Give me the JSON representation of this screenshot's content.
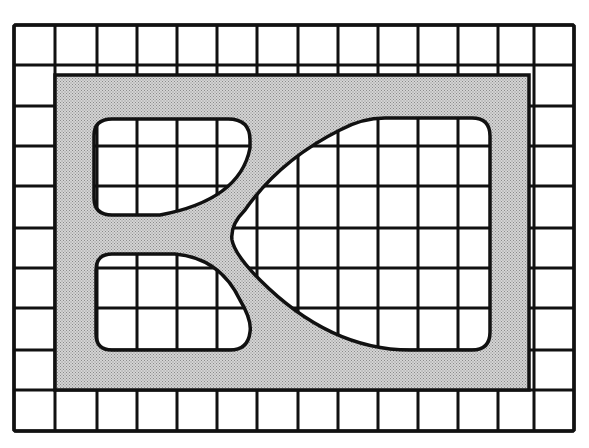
{
  "diagram": {
    "colors": {
      "background": "#ffffff",
      "line": "#111111",
      "shade": "#d4d4d4",
      "stipple": "#8a8a8a"
    },
    "outer_frame": {
      "x": 14,
      "y": 25,
      "w": 560,
      "h": 406
    },
    "grid": {
      "columns_x": [
        14,
        55,
        97,
        137,
        177,
        217,
        257,
        298,
        338,
        378,
        418,
        458,
        498,
        534,
        574
      ],
      "rows_y": [
        25,
        65,
        106,
        146,
        186,
        228,
        268,
        308,
        350,
        390,
        431
      ]
    },
    "shaded_band_outer": {
      "x": 55,
      "y": 75,
      "w": 474,
      "h": 315
    },
    "regions": [
      {
        "name": "upper-left-region",
        "path": "M 112 119 L 228 119 Q 250 119 250 140 L 250 148 Q 240 200 160 215 L 112 215 Q 94 215 94 198 L 94 136 Q 94 119 112 119 Z"
      },
      {
        "name": "lower-left-region",
        "path": "M 112 254 L 175 254 Q 220 258 240 300 Q 252 320 250 332 Q 248 350 230 350 L 112 350 Q 96 350 96 334 L 96 270 Q 96 254 112 254 Z"
      },
      {
        "name": "right-region",
        "path": "M 385 118 L 472 118 Q 490 118 490 136 L 490 332 Q 490 350 472 350 L 410 350 Q 330 350 260 280 Q 235 255 232 240 Q 230 225 245 210 Q 280 160 340 130 Q 362 118 385 118 Z"
      }
    ]
  }
}
